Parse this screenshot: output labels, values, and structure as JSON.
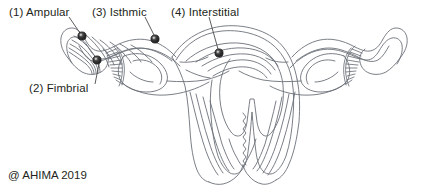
{
  "figure": {
    "background_color": "#ffffff",
    "line_color": "#6b7078",
    "text_color": "#231f20",
    "marker_color": "#2b2b2b"
  },
  "labels": {
    "ampular": "(1) Ampular",
    "fimbrial": "(2) Fimbrial",
    "isthmic": "(3) Isthmic",
    "interstitial": "(4) Interstitial"
  },
  "markers": [
    {
      "number": "1",
      "name": "ampular",
      "x": 82,
      "y": 36
    },
    {
      "number": "2",
      "name": "fimbrial",
      "x": 97,
      "y": 60
    },
    {
      "number": "3",
      "name": "isthmic",
      "x": 155,
      "y": 39
    },
    {
      "number": "4",
      "name": "interstitial",
      "x": 219,
      "y": 53
    }
  ],
  "footer": {
    "copyright": "@ AHIMA 2019"
  }
}
